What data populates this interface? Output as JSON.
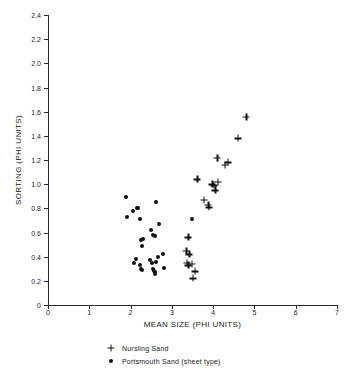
{
  "chart_data": {
    "type": "scatter",
    "title": "",
    "xlabel": "MEAN SIZE (PHI UNITS)",
    "ylabel": "SORTING (PHI UNITS)",
    "xlim": [
      0,
      7
    ],
    "ylim": [
      0,
      2.4
    ],
    "xticks": [
      "0",
      "1",
      "2",
      "3",
      "4",
      "5",
      "6",
      "7"
    ],
    "xtick_values": [
      0,
      1,
      2,
      3,
      4,
      5,
      6,
      7
    ],
    "yticks": [
      "0",
      "0.2",
      "0.4",
      "0.6",
      "0.8",
      "1.0",
      "1.2",
      "1.4",
      "1.6",
      "1.8",
      "2.0",
      "2.2",
      "2.4"
    ],
    "ytick_values": [
      0,
      0.2,
      0.4,
      0.6,
      0.8,
      1.0,
      1.2,
      1.4,
      1.6,
      1.8,
      2.0,
      2.2,
      2.4
    ],
    "grid": false,
    "legend_position": "below-center",
    "marker_color": "#111111",
    "series": [
      {
        "name": "Nursling Sand",
        "marker": "plus",
        "points": [
          [
            3.4,
            0.56
          ],
          [
            3.35,
            0.45
          ],
          [
            3.42,
            0.42
          ],
          [
            3.36,
            0.35
          ],
          [
            3.4,
            0.33
          ],
          [
            3.48,
            0.34
          ],
          [
            3.55,
            0.28
          ],
          [
            3.5,
            0.22
          ],
          [
            3.62,
            1.04
          ],
          [
            3.78,
            0.87
          ],
          [
            3.88,
            0.83
          ],
          [
            3.9,
            0.81
          ],
          [
            3.98,
            1.0
          ],
          [
            4.02,
            0.99
          ],
          [
            4.05,
            0.95
          ],
          [
            4.12,
            1.02
          ],
          [
            4.1,
            1.22
          ],
          [
            4.28,
            1.16
          ],
          [
            4.35,
            1.18
          ],
          [
            4.6,
            1.38
          ],
          [
            4.8,
            1.56
          ]
        ]
      },
      {
        "name": "Portsmouth Sand (sheet type)",
        "marker": "dot",
        "points": [
          [
            1.9,
            0.89
          ],
          [
            1.92,
            0.73
          ],
          [
            2.05,
            0.78
          ],
          [
            2.15,
            0.8
          ],
          [
            2.18,
            0.8
          ],
          [
            2.22,
            0.71
          ],
          [
            2.3,
            0.55
          ],
          [
            2.26,
            0.54
          ],
          [
            2.28,
            0.49
          ],
          [
            2.5,
            0.62
          ],
          [
            2.55,
            0.58
          ],
          [
            2.6,
            0.57
          ],
          [
            2.62,
            0.85
          ],
          [
            2.7,
            0.67
          ],
          [
            2.08,
            0.35
          ],
          [
            2.12,
            0.38
          ],
          [
            2.22,
            0.33
          ],
          [
            2.25,
            0.3
          ],
          [
            2.28,
            0.29
          ],
          [
            2.48,
            0.37
          ],
          [
            2.52,
            0.35
          ],
          [
            2.55,
            0.3
          ],
          [
            2.56,
            0.28
          ],
          [
            2.58,
            0.27
          ],
          [
            2.6,
            0.26
          ],
          [
            2.62,
            0.36
          ],
          [
            2.66,
            0.4
          ],
          [
            2.78,
            0.42
          ],
          [
            2.82,
            0.31
          ],
          [
            3.48,
            0.71
          ]
        ]
      }
    ]
  },
  "legend": {
    "entries": [
      {
        "label": "Nursling Sand",
        "marker": "plus"
      },
      {
        "label": "Portsmouth Sand (sheet type)",
        "marker": "dot"
      }
    ]
  }
}
